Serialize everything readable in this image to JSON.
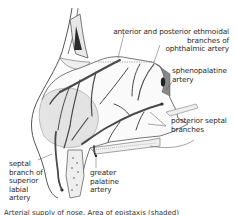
{
  "figure": {
    "labels": {
      "ethmoidal": [
        "anterior and posterior ethmoidal",
        "branches of",
        "ophthalmic artery"
      ],
      "sphenopalatine": [
        "sphenopalatine",
        "artery"
      ],
      "posterior_septal": [
        "posterior septal",
        "branches"
      ],
      "septal_branch": [
        "septal",
        "branch of",
        "superior",
        "labial",
        "artery"
      ],
      "greater_palatine": [
        "greater",
        "palatine",
        "artery"
      ]
    },
    "caption": "Arterial supply of nose. Area of epistaxis (shaded)",
    "colors": {
      "artery": "#4a4a4a",
      "outline": "#555555",
      "shade": "#c8c8c8",
      "bone_fill": "#f4f4f4",
      "text": "#2a2a2a"
    }
  }
}
